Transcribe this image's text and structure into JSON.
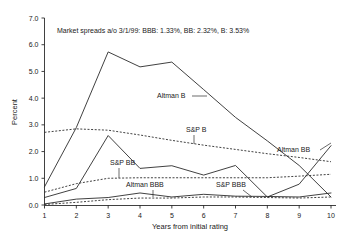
{
  "chart_data": {
    "type": "line",
    "title": "",
    "annotation": "Market spreads a/o 3/1/99:  BBB: 1.33%, BB: 2.32%, B: 3.53%",
    "xlabel": "Years from initial rating",
    "ylabel": "Percent",
    "x": [
      1,
      2,
      3,
      4,
      5,
      6,
      7,
      8,
      9,
      10
    ],
    "xlim": [
      1,
      10
    ],
    "ylim": [
      0.0,
      7.0
    ],
    "ytick_labels": [
      "0.0",
      "1.0",
      "2.0",
      "3.0",
      "4.0",
      "5.0",
      "6.0",
      "7.0"
    ],
    "ytick_values": [
      0.0,
      1.0,
      2.0,
      3.0,
      4.0,
      5.0,
      6.0,
      7.0
    ],
    "xtick_labels": [
      "1",
      "2",
      "3",
      "4",
      "5",
      "6",
      "7",
      "8",
      "9",
      "10"
    ],
    "grid": false,
    "legend": "inline-labels",
    "series": [
      {
        "name": "Altman B",
        "style": "solid",
        "label": "Altman B",
        "values": [
          0.68,
          2.9,
          5.73,
          5.17,
          5.35,
          4.32,
          3.28,
          2.4,
          1.48,
          0.3
        ]
      },
      {
        "name": "S&P B",
        "style": "dotted",
        "label": "S&P B",
        "values": [
          2.72,
          2.85,
          2.8,
          2.62,
          2.42,
          2.24,
          2.08,
          1.92,
          1.78,
          1.62
        ]
      },
      {
        "name": "Altman BB",
        "style": "solid",
        "label": "Altman BB",
        "values": [
          0.28,
          0.62,
          2.6,
          1.37,
          1.47,
          1.12,
          1.48,
          0.3,
          0.78,
          2.22
        ]
      },
      {
        "name": "S&P BB",
        "style": "dotted",
        "label": "S&P BB",
        "values": [
          0.48,
          0.8,
          1.0,
          1.02,
          1.02,
          1.02,
          1.02,
          1.02,
          1.08,
          1.15
        ]
      },
      {
        "name": "Altman BBB",
        "style": "solid",
        "label": "Altman BBB",
        "values": [
          0.04,
          0.22,
          0.28,
          0.45,
          0.3,
          0.4,
          0.33,
          0.32,
          0.3,
          0.45
        ]
      },
      {
        "name": "S&P BBB",
        "style": "dotted",
        "label": "S&P BBB",
        "values": [
          0.02,
          0.1,
          0.2,
          0.26,
          0.26,
          0.3,
          0.3,
          0.28,
          0.26,
          0.3
        ]
      }
    ],
    "series_label_anchors": [
      {
        "name": "Altman B",
        "tx": 157,
        "ty": 98,
        "lx1": 192,
        "ly1": 96,
        "lx2": 207,
        "ly2": 96
      },
      {
        "name": "S&P B",
        "tx": 186,
        "ty": 132,
        "lx1": 194,
        "ly1": 135,
        "lx2": 194,
        "ly2": 144
      },
      {
        "name": "Altman BB",
        "tx": 277,
        "ty": 152,
        "lx1": 320,
        "ly1": 150,
        "lx2": 331,
        "ly2": 143
      },
      {
        "name": "S&P BB",
        "tx": 110,
        "ty": 165,
        "lx1": 119,
        "ly1": 168,
        "lx2": 119,
        "ly2": 178
      },
      {
        "name": "Altman BBB",
        "tx": 126,
        "ty": 187,
        "lx1": 153,
        "ly1": 190,
        "lx2": 153,
        "ly2": 197
      },
      {
        "name": "S&P BBB",
        "tx": 216,
        "ty": 187,
        "lx1": 243,
        "ly1": 190,
        "lx2": 252,
        "ly2": 197
      }
    ],
    "colors": {
      "line": "#2b2b2b",
      "text": "#1a1a1a",
      "background": "#ffffff"
    }
  }
}
